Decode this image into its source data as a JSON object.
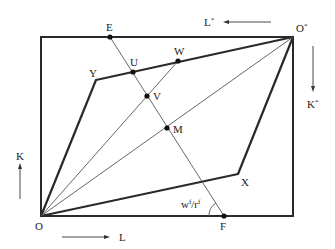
{
  "diagram": {
    "origins": {
      "home": {
        "label": "O",
        "x": 41,
        "y": 216
      },
      "foreign": {
        "label": "O*",
        "x": 293,
        "y": 37
      }
    },
    "axes": {
      "L": {
        "label": "L",
        "direction": "right"
      },
      "K": {
        "label": "K",
        "direction": "up"
      },
      "L_star": {
        "label": "L",
        "sup": "*",
        "direction": "left"
      },
      "K_star": {
        "label": "K",
        "sup": "*",
        "direction": "down"
      }
    },
    "points": [
      {
        "id": "E",
        "label": "E",
        "x": 110,
        "y": 37,
        "dot": true
      },
      {
        "id": "U",
        "label": "U",
        "x": 133,
        "y": 72,
        "dot": true
      },
      {
        "id": "W",
        "label": "W",
        "x": 178,
        "y": 61,
        "dot": true
      },
      {
        "id": "V",
        "label": "V",
        "x": 147,
        "y": 96,
        "dot": true
      },
      {
        "id": "M",
        "label": "M",
        "x": 167,
        "y": 128,
        "dot": true
      },
      {
        "id": "F",
        "label": "F",
        "x": 224,
        "y": 216,
        "dot": true
      },
      {
        "id": "Y",
        "label": "Y",
        "x": 96,
        "y": 80,
        "dot": false
      },
      {
        "id": "X",
        "label": "X",
        "x": 238,
        "y": 174,
        "dot": false
      }
    ],
    "angle_label": {
      "base": "w",
      "sup1": "f",
      "slash": "/r",
      "sup2": "f"
    },
    "lines": [
      {
        "from": "O",
        "to": "Y",
        "style": "thick"
      },
      {
        "from": "Y",
        "to": "O*",
        "style": "thick"
      },
      {
        "from": "O",
        "to": "X",
        "style": "thick"
      },
      {
        "from": "X",
        "to": "O*",
        "style": "thick"
      },
      {
        "from": "O",
        "to": "O*",
        "style": "thin"
      },
      {
        "from": "O",
        "to": "W",
        "style": "thin"
      },
      {
        "from": "E",
        "to": "F",
        "style": "thin"
      }
    ]
  }
}
